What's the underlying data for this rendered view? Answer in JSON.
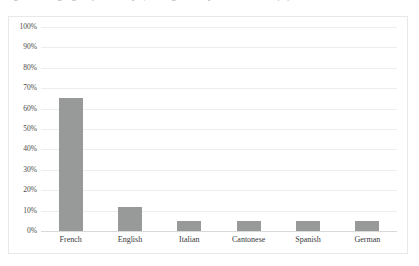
{
  "caption": {
    "text": "Figure 3. Languages of manuscripts, catalogues and printed materials (%)"
  },
  "chart_data": {
    "type": "bar",
    "title": "",
    "xlabel": "",
    "ylabel": "",
    "categories": [
      "French",
      "English",
      "Italian",
      "Cantonese",
      "Spanish",
      "German"
    ],
    "values": [
      65,
      12,
      5,
      5,
      5,
      5
    ],
    "ylim": [
      0,
      100
    ],
    "ytick_labels": [
      "0%",
      "10%",
      "20%",
      "30%",
      "40%",
      "50%",
      "60%",
      "70%",
      "80%",
      "90%",
      "100%"
    ],
    "ytick_values": [
      0,
      10,
      20,
      30,
      40,
      50,
      60,
      70,
      80,
      90,
      100
    ],
    "grid": true,
    "legend": "none",
    "bar_color": "#989999",
    "gridline_color": "#ededed",
    "frame_color": "#e8e8e8"
  }
}
